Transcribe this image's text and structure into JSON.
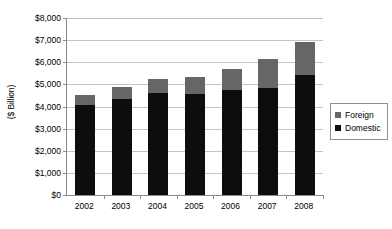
{
  "chart_data": {
    "type": "bar",
    "subtype": "stacked-column",
    "title": "",
    "xlabel": "",
    "ylabel": "($ Billion)",
    "categories": [
      "2002",
      "2003",
      "2004",
      "2005",
      "2006",
      "2007",
      "2008"
    ],
    "series": [
      {
        "name": "Domestic",
        "color": "#0d0d0d",
        "values": [
          4060,
          4350,
          4620,
          4560,
          4730,
          4840,
          5430
        ]
      },
      {
        "name": "Foreign",
        "color": "#666666",
        "values": [
          480,
          550,
          630,
          780,
          950,
          1300,
          1500
        ]
      }
    ],
    "totals": [
      4540,
      4900,
      5250,
      5340,
      5680,
      6140,
      6930
    ],
    "ylim": [
      0,
      8000
    ],
    "ytick_values": [
      0,
      1000,
      2000,
      3000,
      4000,
      5000,
      6000,
      7000,
      8000
    ],
    "ytick_labels": [
      "$0",
      "$1,000",
      "$2,000",
      "$3,000",
      "$4,000",
      "$5,000",
      "$6,000",
      "$7,000",
      "$8,000"
    ],
    "grid": true,
    "grid_axis": "y",
    "legend_position": "right",
    "legend_entries": [
      "Foreign",
      "Domestic"
    ],
    "stack_order_bottom_to_top": [
      "Domestic",
      "Foreign"
    ],
    "colors": {
      "domestic": "#0d0d0d",
      "foreign": "#666666",
      "gridline": "#c4c4c4",
      "axis": "#8a8a8a",
      "background": "#ffffff",
      "text": "#000000"
    }
  }
}
